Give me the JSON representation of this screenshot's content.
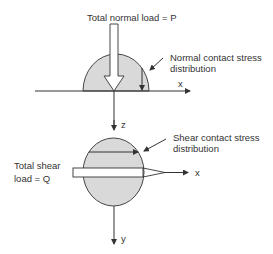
{
  "top_diagram": {
    "load_label": "Total normal load = P",
    "stress_label_line1": "Normal contact stress",
    "stress_label_line2": "distribution",
    "axis_x": "x",
    "axis_z": "z"
  },
  "bottom_diagram": {
    "load_label_line1": "Total shear",
    "load_label_line2": "load = Q",
    "stress_label_line1": "Shear contact stress",
    "stress_label_line2": "distribution",
    "axis_x": "x",
    "axis_y": "y"
  },
  "colors": {
    "fill": "#d9d9d9",
    "stroke": "#333333"
  }
}
